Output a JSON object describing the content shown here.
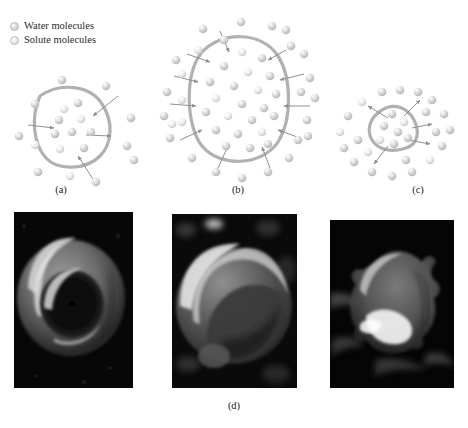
{
  "figure": {
    "title_present": false,
    "panel_labels": {
      "a": "(a)",
      "b": "(b)",
      "c": "(c)",
      "d": "(d)"
    }
  },
  "legend": {
    "items": [
      {
        "label": "Water molecules",
        "marker": "sphere-icon",
        "color": "#d7d7db"
      },
      {
        "label": "Solute molecules",
        "marker": "sphere-icon",
        "color": "#ebebee"
      }
    ]
  },
  "diagrams": {
    "membrane_color": "#b0b0b5",
    "arrow_color": "#8e8e96",
    "panels": [
      {
        "id": "a",
        "caption": "(a)",
        "state": "isotonic",
        "arrow_direction": "bidirectional",
        "cell_size": "normal",
        "inside_molecules": 9,
        "outside_molecules": 11
      },
      {
        "id": "b",
        "caption": "(b)",
        "state": "hypotonic",
        "arrow_direction": "inward",
        "cell_size": "swollen",
        "inside_molecules": 22,
        "outside_molecules": 27
      },
      {
        "id": "c",
        "caption": "(c)",
        "state": "hypertonic",
        "arrow_direction": "outward",
        "cell_size": "shrunken",
        "inside_molecules": 7,
        "outside_molecules": 21
      }
    ]
  },
  "micrographs": {
    "caption": "(d)",
    "panels": [
      {
        "id": "d1",
        "subject": "normal-biconcave-red-blood-cell",
        "background": "#070707"
      },
      {
        "id": "d2",
        "subject": "swollen-spherical-red-blood-cell",
        "background": "#0a0a0a"
      },
      {
        "id": "d3",
        "subject": "crenated-shrunken-red-blood-cell",
        "background": "#050505"
      }
    ]
  }
}
